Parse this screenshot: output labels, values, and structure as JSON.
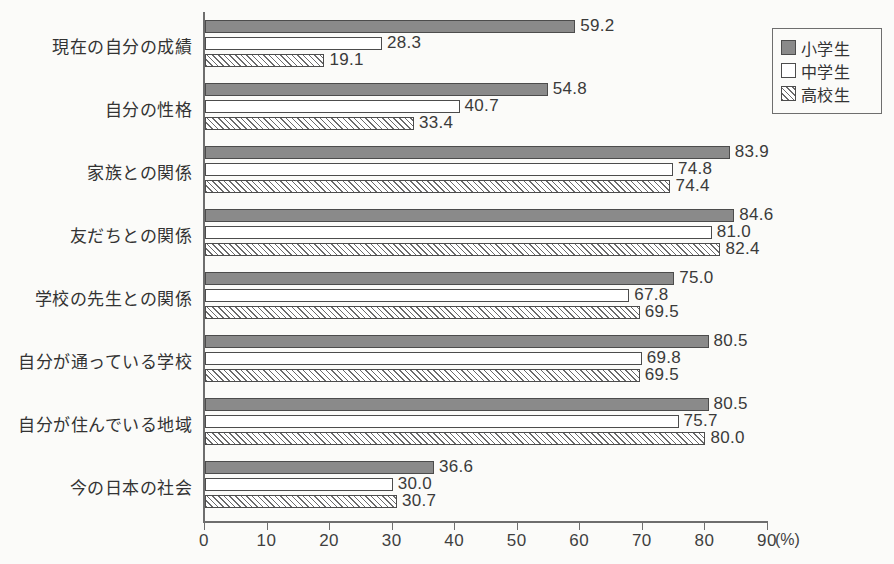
{
  "chart_data": {
    "type": "bar",
    "orientation": "horizontal",
    "title": "",
    "xlabel": "(%)",
    "ylabel": "",
    "xlim": [
      0,
      90
    ],
    "xticks": [
      0,
      10,
      20,
      30,
      40,
      50,
      60,
      70,
      80,
      90
    ],
    "grid": false,
    "legend_position": "top-right",
    "categories": [
      "現在の自分の成績",
      "自分の性格",
      "家族との関係",
      "友だちとの関係",
      "学校の先生との関係",
      "自分が通っている学校",
      "自分が住んでいる地域",
      "今の日本の社会"
    ],
    "series": [
      {
        "name": "小学生",
        "fill": "solid-gray",
        "color": "#8a8a8a",
        "values": [
          59.2,
          54.8,
          83.9,
          84.6,
          75.0,
          80.5,
          80.5,
          36.6
        ],
        "labels": [
          "59.2",
          "54.8",
          "83.9",
          "84.6",
          "75.0",
          "80.5",
          "80.5",
          "36.6"
        ]
      },
      {
        "name": "中学生",
        "fill": "white-outline",
        "color": "#ffffff",
        "values": [
          28.3,
          40.7,
          74.8,
          81.0,
          67.8,
          69.8,
          75.7,
          30.0
        ],
        "labels": [
          "28.3",
          "40.7",
          "74.8",
          "81.0",
          "67.8",
          "69.8",
          "75.7",
          "30.0"
        ]
      },
      {
        "name": "高校生",
        "fill": "diagonal-hatch",
        "color": "#6b6b6b",
        "values": [
          19.1,
          33.4,
          74.4,
          82.4,
          69.5,
          69.5,
          80.0,
          30.7
        ],
        "labels": [
          "19.1",
          "33.4",
          "74.4",
          "82.4",
          "69.5",
          "69.5",
          "80.0",
          "30.7"
        ]
      }
    ]
  },
  "axis": {
    "unit_label": "(%)",
    "tick_labels": [
      "0",
      "10",
      "20",
      "30",
      "40",
      "50",
      "60",
      "70",
      "80",
      "90"
    ]
  },
  "legend": {
    "items": [
      {
        "label": "小学生"
      },
      {
        "label": "中学生"
      },
      {
        "label": "高校生"
      }
    ]
  }
}
